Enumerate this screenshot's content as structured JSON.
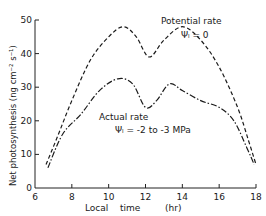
{
  "chart_data": {
    "type": "line",
    "title": "",
    "xlabel": "Local   time        (hr)",
    "ylabel": "Net   photosynthesis   (ng cm⁻² s⁻¹)",
    "xlim": [
      6,
      18
    ],
    "ylim": [
      0,
      50
    ],
    "xticks": [
      6,
      8,
      10,
      12,
      14,
      16,
      18
    ],
    "yticks": [
      0,
      10,
      20,
      30,
      40,
      50
    ],
    "grid": false,
    "legend": "inline annotations",
    "series": [
      {
        "name": "Potential rate",
        "annotation": "Ψ = 0",
        "style": "dashed",
        "x": [
          6.6,
          7.2,
          8.0,
          9.0,
          10.0,
          10.8,
          11.5,
          12.2,
          13.0,
          14.0,
          15.0,
          16.0,
          17.0,
          17.6,
          18.0
        ],
        "y": [
          7,
          15,
          26,
          38,
          45,
          48,
          45,
          39,
          44,
          48,
          44,
          36,
          24,
          14,
          7
        ]
      },
      {
        "name": "Actual rate",
        "annotation": "Ψ = -2 to -3 MPa",
        "style": "dash-dot",
        "x": [
          6.7,
          7.5,
          8.5,
          9.5,
          10.5,
          11.3,
          12.0,
          12.6,
          13.3,
          14.0,
          15.0,
          16.0,
          16.8,
          17.5,
          17.9
        ],
        "y": [
          6,
          16,
          22,
          29,
          32.5,
          31,
          24,
          26,
          31,
          29,
          26,
          24,
          20,
          12,
          7
        ]
      }
    ]
  },
  "labels": {
    "potential_title": "Potential rate",
    "potential_sub": "Ψₗ = 0",
    "actual_title": "Actual rate",
    "actual_sub": "Ψₗ = -2 to -3 MPa",
    "xlabel_a": "Local",
    "xlabel_b": "time",
    "xlabel_c": "(hr)",
    "ylabel": "Net   photosynthesis   (ng cm⁻² s⁻¹)"
  }
}
